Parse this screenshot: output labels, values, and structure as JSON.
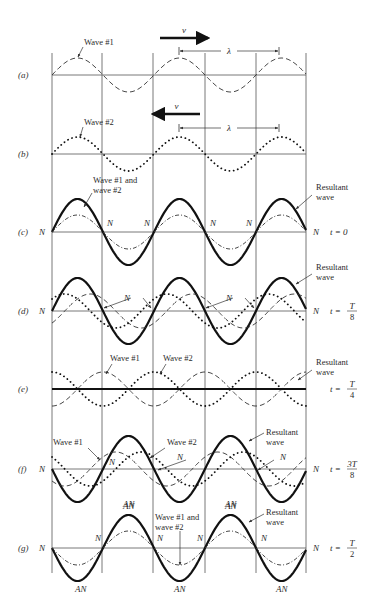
{
  "figure": {
    "geometry": {
      "node_lines_x": [
        52,
        102,
        153,
        205,
        256,
        306
      ],
      "x_start": 52,
      "x_end": 306,
      "half_wavelength_px": 51,
      "line_top": 53,
      "line_bottom": 573,
      "component_amplitude": 17,
      "resultant_amplitude": 33
    },
    "top_arrows": {
      "a": {
        "label": "v",
        "direction": "right",
        "x1": 160,
        "x2": 208,
        "y": 38
      },
      "b": {
        "label": "v",
        "direction": "left",
        "x1": 200,
        "x2": 153,
        "y": 114
      }
    },
    "wavelength_markers": {
      "a": {
        "label": "λ",
        "x1": 179,
        "x2": 279,
        "y": 51
      },
      "b": {
        "label": "λ",
        "x1": 179,
        "x2": 279,
        "y": 128
      }
    },
    "panels": [
      {
        "id": "a",
        "label": "(a)",
        "axis_y": 75,
        "time": "",
        "left_node": "",
        "right_node": "",
        "curves": [
          {
            "name": "wave-1",
            "style": "dash",
            "amp": 17,
            "phase_shift_px": 0,
            "sign": 1
          }
        ],
        "annotations": [
          {
            "text": "Wave #1",
            "x": 84,
            "y": 45
          }
        ]
      },
      {
        "id": "b",
        "label": "(b)",
        "axis_y": 154,
        "time": "",
        "left_node": "",
        "right_node": "",
        "curves": [
          {
            "name": "wave-2",
            "style": "dot",
            "amp": 17,
            "phase_shift_px": 0,
            "sign": 1
          }
        ],
        "annotations": [
          {
            "text": "Wave #2",
            "x": 84,
            "y": 125
          }
        ]
      },
      {
        "id": "c",
        "label": "(c)",
        "axis_y": 232,
        "time": "t = 0",
        "left_node": "N",
        "right_node": "N",
        "curves": [
          {
            "name": "resultant",
            "style": "res",
            "amp": 33,
            "phase_shift_px": 0,
            "sign": 1
          },
          {
            "name": "wave-1-and-2",
            "style": "dashdot",
            "amp": 17,
            "phase_shift_px": 0,
            "sign": 1
          }
        ],
        "annotations": [
          {
            "text": "Wave #1 and",
            "x": 93,
            "y": 183
          },
          {
            "text": "wave #2",
            "x": 93,
            "y": 193
          },
          {
            "text": "Resultant",
            "x": 316,
            "y": 190
          },
          {
            "text": "wave",
            "x": 316,
            "y": 200
          }
        ],
        "node_labels": [
          {
            "text": "N",
            "x": 107,
            "y": 226
          },
          {
            "text": "N",
            "x": 144,
            "y": 226
          },
          {
            "text": "N",
            "x": 210,
            "y": 226
          },
          {
            "text": "N",
            "x": 246,
            "y": 226
          }
        ]
      },
      {
        "id": "d",
        "label": "(d)",
        "axis_y": 311,
        "time_num": "T",
        "time_den": "8",
        "time_prefix": "t =",
        "left_node": "N",
        "right_node": "N",
        "curves": [
          {
            "name": "resultant",
            "style": "res",
            "amp": 33,
            "phase_shift_px": 0,
            "sign": 1
          },
          {
            "name": "wave-1",
            "style": "dash",
            "amp": 17,
            "phase_shift_px": 12.75,
            "sign": 1
          },
          {
            "name": "wave-2",
            "style": "dot",
            "amp": 17,
            "phase_shift_px": -12.75,
            "sign": 1
          }
        ],
        "annotations": [
          {
            "text": "Resultant",
            "x": 316,
            "y": 270
          },
          {
            "text": "wave",
            "x": 316,
            "y": 280
          }
        ],
        "node_labels": [
          {
            "text": "N",
            "x": 124,
            "y": 301
          },
          {
            "text": "N",
            "x": 226,
            "y": 301
          }
        ]
      },
      {
        "id": "e",
        "label": "(e)",
        "axis_y": 389,
        "time_num": "T",
        "time_den": "4",
        "time_prefix": "t =",
        "left_node": "",
        "right_node": "",
        "curves": [
          {
            "name": "wave-1",
            "style": "dash",
            "amp": 17,
            "phase_shift_px": 25.5,
            "sign": 1
          },
          {
            "name": "wave-2",
            "style": "dot",
            "amp": 17,
            "phase_shift_px": -25.5,
            "sign": 1
          },
          {
            "name": "resultant",
            "style": "resflat",
            "amp": 0,
            "phase_shift_px": 0,
            "sign": 1
          }
        ],
        "annotations": [
          {
            "text": "Wave #1",
            "x": 110,
            "y": 361
          },
          {
            "text": "Wave #2",
            "x": 163,
            "y": 361
          },
          {
            "text": "Resultant",
            "x": 316,
            "y": 365
          },
          {
            "text": "wave",
            "x": 316,
            "y": 375
          }
        ]
      },
      {
        "id": "f",
        "label": "(f)",
        "axis_y": 469,
        "time_num": "3T",
        "time_den": "8",
        "time_prefix": "t =",
        "left_node": "N",
        "right_node": "N",
        "curves": [
          {
            "name": "resultant",
            "style": "res",
            "amp": 33,
            "phase_shift_px": 0,
            "sign": -1
          },
          {
            "name": "wave-1",
            "style": "dash",
            "amp": 17,
            "phase_shift_px": 38.25,
            "sign": 1
          },
          {
            "name": "wave-2",
            "style": "dot",
            "amp": 17,
            "phase_shift_px": -38.25,
            "sign": 1
          }
        ],
        "annotations": [
          {
            "text": "Wave #1",
            "x": 53,
            "y": 445
          },
          {
            "text": "Wave #2",
            "x": 167,
            "y": 445
          },
          {
            "text": "Resultant",
            "x": 266,
            "y": 435
          },
          {
            "text": "wave",
            "x": 266,
            "y": 445
          }
        ],
        "node_labels": [
          {
            "text": "N",
            "x": 109,
            "y": 465
          },
          {
            "text": "N",
            "x": 177,
            "y": 460
          },
          {
            "text": "N",
            "x": 280,
            "y": 460
          }
        ],
        "antinode_labels": [
          {
            "text": "AN",
            "x": 123,
            "y": 507
          },
          {
            "text": "AN",
            "x": 225,
            "y": 507
          }
        ]
      },
      {
        "id": "g",
        "label": "(g)",
        "axis_y": 548,
        "time_num": "T",
        "time_den": "2",
        "time_prefix": "t =",
        "left_node": "N",
        "right_node": "N",
        "curves": [
          {
            "name": "resultant",
            "style": "res",
            "amp": 33,
            "phase_shift_px": 0,
            "sign": -1
          },
          {
            "name": "wave-1-and-2",
            "style": "dashdot",
            "amp": 17,
            "phase_shift_px": 0,
            "sign": -1
          }
        ],
        "annotations": [
          {
            "text": "Wave #1 and",
            "x": 155,
            "y": 520
          },
          {
            "text": "wave #2",
            "x": 155,
            "y": 530
          },
          {
            "text": "Resultant",
            "x": 266,
            "y": 515
          },
          {
            "text": "wave",
            "x": 266,
            "y": 525
          }
        ],
        "node_labels": [
          {
            "text": "N",
            "x": 95,
            "y": 541
          },
          {
            "text": "N",
            "x": 157,
            "y": 541
          },
          {
            "text": "N",
            "x": 197,
            "y": 541
          },
          {
            "text": "N",
            "x": 261,
            "y": 541
          }
        ],
        "antinode_labels": [
          {
            "text": "AN",
            "x": 75,
            "y": 592
          },
          {
            "text": "AN",
            "x": 174,
            "y": 592
          },
          {
            "text": "AN",
            "x": 276,
            "y": 592
          },
          {
            "text": "AN",
            "x": 123,
            "y": 509
          },
          {
            "text": "AN",
            "x": 225,
            "y": 509
          }
        ]
      }
    ]
  }
}
